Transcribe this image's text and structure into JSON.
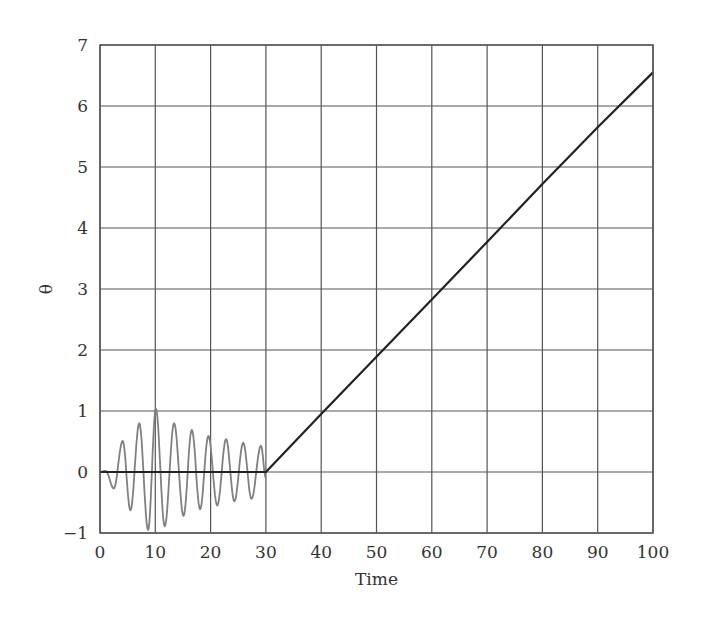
{
  "chart_data": {
    "type": "line",
    "title": "",
    "xlabel": "Time",
    "ylabel": "θ",
    "xlim": [
      0,
      100
    ],
    "ylim": [
      -1,
      7
    ],
    "grid": true,
    "legend": null,
    "x_ticks": [
      0,
      10,
      20,
      30,
      40,
      50,
      60,
      70,
      80,
      90,
      100
    ],
    "y_ticks": [
      -1,
      0,
      1,
      2,
      3,
      4,
      5,
      6,
      7
    ],
    "x_tick_labels": [
      "0",
      "10",
      "20",
      "30",
      "40",
      "50",
      "60",
      "70",
      "80",
      "90",
      "100"
    ],
    "y_tick_labels": [
      "−1",
      "0",
      "1",
      "2",
      "3",
      "4",
      "5",
      "6",
      "7"
    ],
    "series": [
      {
        "name": "oscillation",
        "color": "#808080",
        "x": [
          0,
          1,
          2.5,
          4.1,
          5.5,
          7.1,
          8.7,
          10.1,
          11.7,
          13.4,
          15.1,
          16.6,
          18.1,
          19.6,
          21.2,
          22.8,
          24.3,
          25.9,
          27.4,
          29.1,
          30
        ],
        "y": [
          0,
          0.02,
          -0.27,
          0.51,
          -0.63,
          0.8,
          -0.95,
          1.04,
          -0.89,
          0.8,
          -0.72,
          0.69,
          -0.61,
          0.59,
          -0.55,
          0.54,
          -0.48,
          0.48,
          -0.44,
          0.43,
          -0.1
        ]
      },
      {
        "name": "theta",
        "color": "#222222",
        "x": [
          0,
          30,
          40,
          50,
          60,
          70,
          80,
          90,
          100
        ],
        "y": [
          0,
          0,
          0.95,
          1.89,
          2.83,
          3.77,
          4.72,
          5.65,
          6.55
        ]
      }
    ]
  }
}
